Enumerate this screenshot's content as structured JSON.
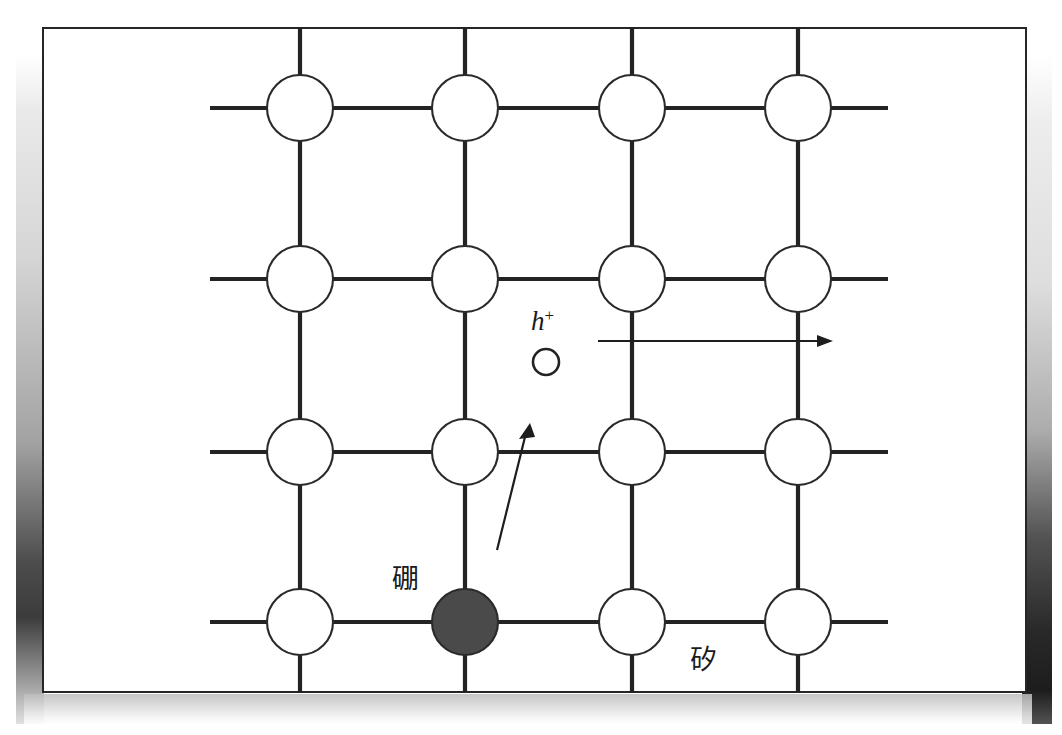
{
  "figure": {
    "frame_border_color": "#262626",
    "background_color": "#ffffff"
  },
  "labels": {
    "dopant": "硼",
    "host": "矽",
    "hole_symbol": "h",
    "hole_charge": "+"
  },
  "lattice": {
    "columns": 4,
    "rows": 4,
    "column_x": [
      258,
      423,
      590,
      756
    ],
    "row_y": [
      81,
      252,
      425,
      595
    ],
    "atom_radius": 33,
    "stub_length": 57,
    "atom_fill": "#ffffff",
    "atom_stroke": "#2a2a2a",
    "bond_color": "#232323",
    "dopant_cell": {
      "row": 3,
      "col": 1,
      "fill": "#4a4a4a"
    }
  },
  "hole": {
    "cx": 504,
    "cy": 335,
    "r": 13,
    "fill": "#ffffff",
    "stroke": "#232323"
  },
  "arrows": [
    {
      "name": "hole-drift-arrow",
      "from": [
        556,
        314
      ],
      "to": [
        791,
        314
      ],
      "direction": "right"
    },
    {
      "name": "electron-transition-arrow",
      "from": [
        455,
        523
      ],
      "to": [
        488,
        396
      ],
      "direction": "up-right"
    }
  ]
}
